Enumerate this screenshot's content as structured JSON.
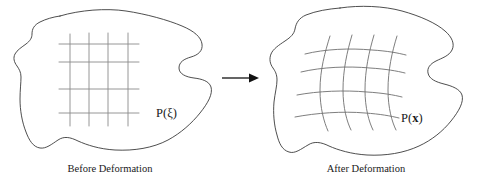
{
  "figure": {
    "type": "deformation-diagram",
    "background_color": "#ffffff",
    "outline_color": "#3a3a3a",
    "grid_color": "#8a8a8a",
    "arrow_color": "#111111",
    "text_color": "#1a1a1a"
  },
  "left_panel": {
    "caption": "Before Deformation",
    "caption_x": 110,
    "caption_y": 172,
    "point_label_prefix": "P(",
    "point_label_variable": "ξ",
    "point_label_suffix": ")",
    "point_label_x": 156,
    "point_label_y": 117,
    "grid": {
      "type": "undeformed-rectangular",
      "vertical_lines": 4,
      "horizontal_lines": 4,
      "x_positions": [
        70,
        89,
        108,
        128
      ],
      "y_positions": [
        44,
        62,
        89,
        113
      ],
      "x_extent": [
        59,
        139
      ],
      "y_extent": [
        34,
        126
      ]
    }
  },
  "right_panel": {
    "caption": "After Deformation",
    "caption_x": 366,
    "caption_y": 172,
    "point_label_prefix": "P(",
    "point_label_variable": "x",
    "point_label_suffix": ")",
    "point_label_x": 401,
    "point_label_y": 122,
    "grid": {
      "type": "deformed-curvilinear",
      "vertical_lines": 4,
      "horizontal_lines": 4,
      "x_positions": [
        323,
        345,
        367,
        390
      ],
      "y_positions": [
        51,
        69,
        93,
        115
      ],
      "x_extent": [
        305,
        403
      ],
      "y_extent": [
        36,
        131
      ]
    }
  },
  "arrow": {
    "name": "deformation-arrow",
    "x_start": 222,
    "x_end": 259,
    "y": 78,
    "direction": "right"
  }
}
